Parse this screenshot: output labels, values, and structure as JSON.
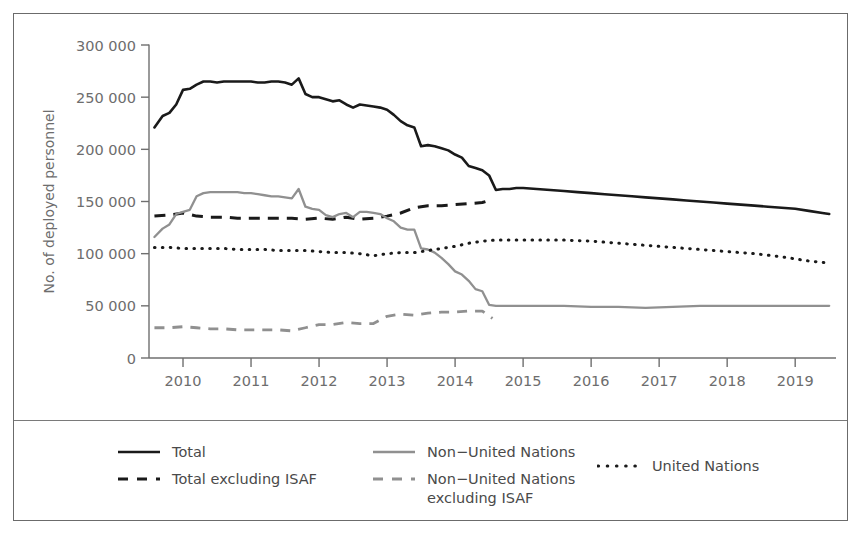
{
  "figure": {
    "border_color": "#6b6b6b",
    "background": "#ffffff"
  },
  "chart_data": {
    "type": "line",
    "title": "",
    "subtitle": "",
    "xlabel": "",
    "ylabel": "No. of deployed personnel",
    "xlim": [
      2009.5,
      2019.6
    ],
    "ylim": [
      0,
      300000
    ],
    "grid": false,
    "legend_position": "below-plot",
    "x_tick_labels": [
      "2010",
      "2011",
      "2012",
      "2013",
      "2014",
      "2015",
      "2016",
      "2017",
      "2018",
      "2019"
    ],
    "x_ticks": [
      2010,
      2011,
      2012,
      2013,
      2014,
      2015,
      2016,
      2017,
      2018,
      2019
    ],
    "y_tick_labels": [
      "0",
      "50 000",
      "100 000",
      "150 000",
      "200 000",
      "250 000",
      "300 000"
    ],
    "y_ticks": [
      0,
      50000,
      100000,
      150000,
      200000,
      250000,
      300000
    ],
    "series": [
      {
        "name": "Total",
        "style": "solid",
        "color": "#1a1a1a",
        "x": [
          2009.58,
          2009.7,
          2009.8,
          2009.9,
          2010.0,
          2010.1,
          2010.2,
          2010.3,
          2010.4,
          2010.5,
          2010.6,
          2010.7,
          2010.8,
          2010.9,
          2011.0,
          2011.1,
          2011.2,
          2011.3,
          2011.4,
          2011.5,
          2011.6,
          2011.7,
          2011.8,
          2011.9,
          2012.0,
          2012.1,
          2012.2,
          2012.3,
          2012.4,
          2012.5,
          2012.6,
          2012.7,
          2012.8,
          2012.9,
          2013.0,
          2013.1,
          2013.2,
          2013.3,
          2013.4,
          2013.5,
          2013.6,
          2013.7,
          2013.8,
          2013.9,
          2014.0,
          2014.1,
          2014.2,
          2014.3,
          2014.4,
          2014.5,
          2014.6,
          2014.7,
          2014.8,
          2014.9,
          2015.0,
          2015.2,
          2015.4,
          2015.6,
          2015.8,
          2016.0,
          2016.2,
          2016.4,
          2016.6,
          2016.8,
          2017.0,
          2017.2,
          2017.4,
          2017.6,
          2017.8,
          2018.0,
          2018.2,
          2018.4,
          2018.6,
          2018.8,
          2019.0,
          2019.2,
          2019.4,
          2019.5
        ],
        "y": [
          221000,
          232000,
          235000,
          243000,
          257000,
          258000,
          262000,
          265000,
          265000,
          264000,
          265000,
          265000,
          265000,
          265000,
          265000,
          264000,
          264000,
          265000,
          265000,
          264000,
          262000,
          268000,
          253000,
          250000,
          250000,
          248000,
          246000,
          247000,
          243000,
          240000,
          243000,
          242000,
          241000,
          240000,
          238000,
          233000,
          227000,
          223000,
          221000,
          203000,
          204000,
          203000,
          201000,
          199000,
          195000,
          192000,
          184000,
          182000,
          180000,
          175000,
          161000,
          162000,
          162000,
          163000,
          163000,
          162000,
          161000,
          160000,
          159000,
          158000,
          157000,
          156000,
          155000,
          154000,
          153000,
          152000,
          151000,
          150000,
          149000,
          148000,
          147000,
          146000,
          145000,
          144000,
          143000,
          141000,
          139000,
          138000
        ]
      },
      {
        "name": "Total excluding ISAF",
        "style": "dashed",
        "color": "#1a1a1a",
        "x": [
          2009.58,
          2009.8,
          2010.0,
          2010.2,
          2010.4,
          2010.6,
          2010.8,
          2011.0,
          2011.2,
          2011.4,
          2011.6,
          2011.8,
          2012.0,
          2012.2,
          2012.4,
          2012.6,
          2012.8,
          2013.0,
          2013.2,
          2013.4,
          2013.6,
          2013.8,
          2014.0,
          2014.2,
          2014.4,
          2014.55
        ],
        "y": [
          136000,
          137000,
          139000,
          136000,
          135000,
          135000,
          134000,
          134000,
          134000,
          134000,
          134000,
          133000,
          134000,
          133000,
          135000,
          133000,
          134000,
          136000,
          139000,
          144000,
          146000,
          146000,
          147000,
          148000,
          149000,
          152000
        ]
      },
      {
        "name": "Non-United Nations",
        "style": "solid",
        "color": "#909090",
        "x": [
          2009.58,
          2009.7,
          2009.8,
          2009.9,
          2010.0,
          2010.1,
          2010.2,
          2010.3,
          2010.4,
          2010.5,
          2010.6,
          2010.7,
          2010.8,
          2010.9,
          2011.0,
          2011.1,
          2011.2,
          2011.3,
          2011.4,
          2011.5,
          2011.6,
          2011.7,
          2011.8,
          2011.9,
          2012.0,
          2012.1,
          2012.2,
          2012.3,
          2012.4,
          2012.5,
          2012.6,
          2012.7,
          2012.8,
          2012.9,
          2013.0,
          2013.1,
          2013.2,
          2013.3,
          2013.4,
          2013.5,
          2013.6,
          2013.7,
          2013.8,
          2013.9,
          2014.0,
          2014.1,
          2014.2,
          2014.3,
          2014.4,
          2014.5,
          2014.6,
          2014.7,
          2014.8,
          2015.0,
          2015.3,
          2015.6,
          2016.0,
          2016.4,
          2016.8,
          2017.2,
          2017.6,
          2018.0,
          2018.4,
          2018.8,
          2019.2,
          2019.5
        ],
        "y": [
          116000,
          124000,
          128000,
          138000,
          140000,
          142000,
          155000,
          158000,
          159000,
          159000,
          159000,
          159000,
          159000,
          158000,
          158000,
          157000,
          156000,
          155000,
          155000,
          154000,
          153000,
          162000,
          145000,
          143000,
          142000,
          137000,
          135000,
          138000,
          139000,
          135000,
          140000,
          140000,
          139000,
          138000,
          134000,
          131000,
          125000,
          123000,
          123000,
          105000,
          104000,
          101000,
          96000,
          90000,
          83000,
          80000,
          74000,
          66000,
          64000,
          51000,
          50000,
          50000,
          50000,
          50000,
          50000,
          50000,
          49000,
          49000,
          48000,
          49000,
          50000,
          50000,
          50000,
          50000,
          50000,
          50000
        ]
      },
      {
        "name": "Non-United Nations excluding ISAF",
        "style": "dashed",
        "color": "#909090",
        "x": [
          2009.58,
          2009.8,
          2010.0,
          2010.2,
          2010.4,
          2010.6,
          2010.8,
          2011.0,
          2011.2,
          2011.4,
          2011.6,
          2011.8,
          2012.0,
          2012.2,
          2012.4,
          2012.6,
          2012.8,
          2013.0,
          2013.2,
          2013.4,
          2013.6,
          2013.8,
          2014.0,
          2014.2,
          2014.4,
          2014.55
        ],
        "y": [
          29000,
          29000,
          30000,
          29000,
          28000,
          28000,
          27000,
          27000,
          27000,
          27000,
          26000,
          29000,
          32000,
          32000,
          34000,
          33000,
          33000,
          40000,
          42000,
          41000,
          43000,
          44000,
          44000,
          45000,
          45000,
          38000
        ]
      },
      {
        "name": "United Nations",
        "style": "dotted",
        "color": "#1a1a1a",
        "x": [
          2009.58,
          2009.8,
          2010.0,
          2010.2,
          2010.4,
          2010.6,
          2010.8,
          2011.0,
          2011.2,
          2011.4,
          2011.6,
          2011.8,
          2012.0,
          2012.2,
          2012.4,
          2012.6,
          2012.8,
          2013.0,
          2013.2,
          2013.4,
          2013.6,
          2013.8,
          2014.0,
          2014.2,
          2014.4,
          2014.6,
          2014.8,
          2015.0,
          2015.3,
          2015.6,
          2016.0,
          2016.4,
          2016.8,
          2017.2,
          2017.6,
          2018.0,
          2018.4,
          2018.8,
          2019.2,
          2019.5
        ],
        "y": [
          106000,
          106000,
          105000,
          105000,
          105000,
          105000,
          104000,
          104000,
          104000,
          103000,
          103000,
          103000,
          102000,
          101000,
          101000,
          100000,
          98000,
          100000,
          101000,
          101000,
          103000,
          105000,
          107000,
          110000,
          112000,
          113000,
          113000,
          113000,
          113000,
          113000,
          112000,
          110000,
          108000,
          106000,
          104000,
          102000,
          100000,
          97000,
          93000,
          91000
        ]
      }
    ]
  },
  "legend": {
    "items": [
      {
        "label": "Total",
        "style": "solid",
        "color": "#1a1a1a"
      },
      {
        "label": "Total excluding ISAF",
        "style": "dashed",
        "color": "#1a1a1a"
      },
      {
        "label": "Non−United Nations",
        "style": "solid",
        "color": "#909090"
      },
      {
        "label": "Non−United Nations\nexcluding ISAF",
        "style": "dashed",
        "color": "#909090"
      },
      {
        "label": "United Nations",
        "style": "dotted",
        "color": "#1a1a1a"
      }
    ]
  }
}
